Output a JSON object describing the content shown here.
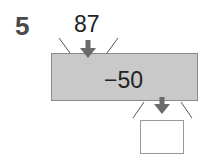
{
  "problem": {
    "number": "5",
    "input_value": "87",
    "operation": "−50",
    "answer": ""
  },
  "colors": {
    "machine_fill": "#c9c9c9",
    "machine_border": "#8a8a8a",
    "arrow": "#6a6a6a"
  }
}
